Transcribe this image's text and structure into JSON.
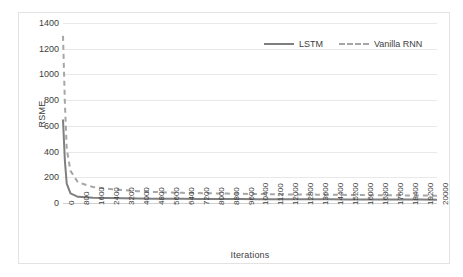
{
  "chart_data": {
    "type": "line",
    "title": "",
    "xlabel": "Iterations",
    "ylabel": "RSME",
    "xlim": [
      0,
      20000
    ],
    "ylim": [
      0,
      1400
    ],
    "grid": true,
    "legend_position": "top-right",
    "y_ticks": [
      0,
      200,
      400,
      600,
      800,
      1000,
      1200,
      1400
    ],
    "y_tick_labels": [
      "0",
      "200",
      "400",
      "600",
      "800",
      "1000",
      "1200",
      "1400"
    ],
    "x_ticks": [
      0,
      800,
      1600,
      2400,
      3200,
      4000,
      4800,
      5600,
      6400,
      7200,
      8000,
      8800,
      9600,
      10400,
      11200,
      12000,
      12800,
      13600,
      14400,
      15200,
      16000,
      16800,
      17600,
      18400,
      19200,
      20000
    ],
    "x_tick_labels": [
      "0",
      "800",
      "1600",
      "2400",
      "3200",
      "4000",
      "4800",
      "5600",
      "6400",
      "7200",
      "8000",
      "8800",
      "9600",
      "10400",
      "11200",
      "12000",
      "12800",
      "13600",
      "14400",
      "15200",
      "16000",
      "16800",
      "17600",
      "18400",
      "19200",
      "20000"
    ],
    "colors": {
      "lstm": "#7f7f7f",
      "vanilla_rnn": "#a6a6a6",
      "gridline": "#e8e8e8",
      "axis": "#d0d0d0",
      "text": "#404040"
    },
    "series": [
      {
        "name": "LSTM",
        "style": "solid",
        "color": "#7f7f7f",
        "x": [
          0,
          100,
          200,
          400,
          800,
          1600,
          2400,
          3200,
          4000,
          4800,
          5600,
          6400,
          7200,
          8000,
          8800,
          9600,
          10400,
          11200,
          12000,
          12800,
          13600,
          14400,
          15200,
          16000,
          16800,
          17600,
          18400,
          19200,
          20000
        ],
        "values": [
          650,
          330,
          150,
          75,
          48,
          40,
          38,
          36,
          35,
          34,
          33,
          33,
          32,
          32,
          31,
          31,
          30,
          30,
          30,
          29,
          29,
          29,
          28,
          28,
          28,
          27,
          27,
          27,
          26
        ]
      },
      {
        "name": "Vanilla RNN",
        "style": "dashed",
        "color": "#a6a6a6",
        "x": [
          0,
          100,
          200,
          400,
          800,
          1600,
          2400,
          3200,
          4000,
          4800,
          5600,
          6400,
          7200,
          8000,
          8800,
          9600,
          10400,
          11200,
          12000,
          12800,
          13600,
          14400,
          15200,
          16000,
          16800,
          17600,
          18400,
          19200,
          20000
        ],
        "values": [
          1300,
          780,
          420,
          250,
          160,
          125,
          110,
          100,
          92,
          86,
          82,
          79,
          77,
          75,
          73,
          71,
          70,
          68,
          67,
          66,
          65,
          64,
          63,
          62,
          61,
          60,
          59,
          58,
          57
        ]
      }
    ]
  },
  "legend": {
    "items": [
      {
        "label": "LSTM",
        "style": "solid",
        "color": "#7f7f7f"
      },
      {
        "label": "Vanilla RNN",
        "style": "dashed",
        "color": "#a6a6a6"
      }
    ]
  }
}
